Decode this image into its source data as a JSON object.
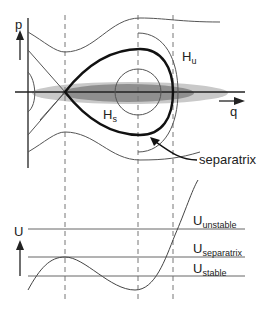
{
  "phase_plot": {
    "p_axis_label": "p",
    "q_axis_label": "q",
    "hu_main": "H",
    "hu_sub": "u",
    "hs_main": "H",
    "hs_sub": "s",
    "separatrix_label": "separatrix",
    "colors": {
      "separatrix": "#111111",
      "orbits": "#555555",
      "ellipse_light": "#c8c8c8",
      "ellipse_dark": "#8f8f8f",
      "dashed": "#777777"
    }
  },
  "potential_plot": {
    "u_axis_label": "U",
    "levels": [
      {
        "main": "U",
        "sub": "unstable"
      },
      {
        "main": "U",
        "sub": "separatrix"
      },
      {
        "main": "U",
        "sub": "stable"
      }
    ]
  }
}
